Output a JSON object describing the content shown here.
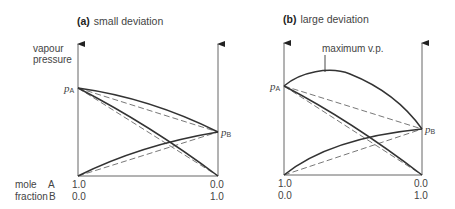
{
  "figure": {
    "panel_a": {
      "letter": "(a)",
      "title": "small deviation",
      "p_a": "p",
      "p_a_sub": "A",
      "p_b": "p",
      "p_b_sub": "B",
      "x_left_A": "1.0",
      "x_left_B": "0.0",
      "x_right_A": "0.0",
      "x_right_B": "1.0"
    },
    "panel_b": {
      "letter": "(b)",
      "title": "large deviation",
      "annotation": "maximum v.p.",
      "p_a": "p",
      "p_a_sub": "A",
      "p_b": "p",
      "p_b_sub": "B",
      "x_left_A": "1.0",
      "x_left_B": "0.0",
      "x_right_A": "0.0",
      "x_right_B": "1.0"
    },
    "y_axis_label_line1": "vapour",
    "y_axis_label_line2": "pressure",
    "x_axis_label_line1": "mole",
    "x_axis_label_line2": "fraction",
    "x_axis_A": "A",
    "x_axis_B": "B"
  },
  "colors": {
    "line": "#333333",
    "axis": "#555555",
    "dash": "#555555"
  }
}
